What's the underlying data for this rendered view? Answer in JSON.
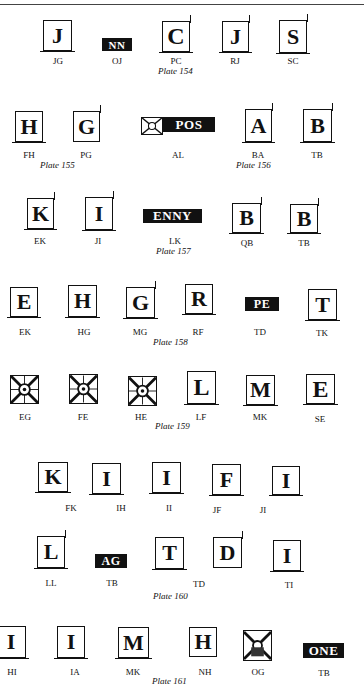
{
  "page": {
    "rows": [
      {
        "plate": "Plate 154",
        "marks": [
          {
            "glyph": "J",
            "code": "JG",
            "style": "box"
          },
          {
            "glyph": "NN",
            "code": "OJ",
            "style": "inverse"
          },
          {
            "glyph": "C",
            "code": "PC",
            "style": "box"
          },
          {
            "glyph": "J",
            "code": "RJ",
            "style": "box"
          },
          {
            "glyph": "S",
            "code": "SC",
            "style": "box"
          }
        ]
      },
      {
        "plates": [
          "Plate 155",
          "Plate 156"
        ],
        "marks": [
          {
            "glyph": "H",
            "code": "FH",
            "style": "box"
          },
          {
            "glyph": "G",
            "code": "PG",
            "style": "box"
          },
          {
            "glyph": "POS",
            "code": "AL",
            "style": "sun-inverse"
          },
          {
            "glyph": "A",
            "code": "BA",
            "style": "box"
          },
          {
            "glyph": "B",
            "code": "TB",
            "style": "box"
          }
        ]
      },
      {
        "plate": "Plate 157",
        "marks": [
          {
            "glyph": "K",
            "code": "EK",
            "style": "box"
          },
          {
            "glyph": "I",
            "code": "JI",
            "style": "box"
          },
          {
            "glyph": "ENNY",
            "code": "LK",
            "style": "inverse"
          },
          {
            "glyph": "B",
            "code": "QB",
            "style": "box"
          },
          {
            "glyph": "B",
            "code": "TB",
            "style": "box"
          }
        ]
      },
      {
        "plate": "Plate 158",
        "marks": [
          {
            "glyph": "E",
            "code": "EK",
            "style": "box"
          },
          {
            "glyph": "H",
            "code": "HG",
            "style": "box"
          },
          {
            "glyph": "G",
            "code": "MG",
            "style": "box"
          },
          {
            "glyph": "R",
            "code": "RF",
            "style": "box"
          },
          {
            "glyph": "PE",
            "code": "TD",
            "style": "inverse"
          },
          {
            "glyph": "T",
            "code": "TK",
            "style": "box"
          }
        ]
      },
      {
        "plate": "Plate 159",
        "marks": [
          {
            "glyph": "sun",
            "code": "EG",
            "style": "sun"
          },
          {
            "glyph": "sun",
            "code": "FE",
            "style": "sun"
          },
          {
            "glyph": "sun",
            "code": "HE",
            "style": "sun"
          },
          {
            "glyph": "L",
            "code": "LF",
            "style": "box"
          },
          {
            "glyph": "M",
            "code": "MK",
            "style": "box"
          },
          {
            "glyph": "E",
            "code": "SE",
            "style": "box"
          }
        ]
      },
      {
        "marks": [
          {
            "glyph": "K",
            "code": "FK",
            "style": "box"
          },
          {
            "glyph": "I",
            "code": "IH",
            "style": "box"
          },
          {
            "glyph": "I",
            "code": "II",
            "style": "box"
          },
          {
            "glyph": "F",
            "code": "JF",
            "style": "box"
          },
          {
            "glyph": "I",
            "code": "JI",
            "style": "box"
          }
        ]
      },
      {
        "plate": "Plate 160",
        "marks": [
          {
            "glyph": "L",
            "code": "LL",
            "style": "box"
          },
          {
            "glyph": "AG",
            "code": "TB",
            "style": "inverse"
          },
          {
            "glyph": "T",
            "code": "TD",
            "style": "box"
          },
          {
            "glyph": "D",
            "code": "",
            "style": "box"
          },
          {
            "glyph": "I",
            "code": "TI",
            "style": "box"
          }
        ]
      },
      {
        "plate": "Plate 161",
        "marks": [
          {
            "glyph": "I",
            "code": "HI",
            "style": "box"
          },
          {
            "glyph": "I",
            "code": "IA",
            "style": "box"
          },
          {
            "glyph": "M",
            "code": "MK",
            "style": "box"
          },
          {
            "glyph": "H",
            "code": "NH",
            "style": "box"
          },
          {
            "glyph": "sun",
            "code": "OG",
            "style": "sun"
          },
          {
            "glyph": "ONE",
            "code": "TB",
            "style": "inverse"
          }
        ]
      }
    ]
  }
}
